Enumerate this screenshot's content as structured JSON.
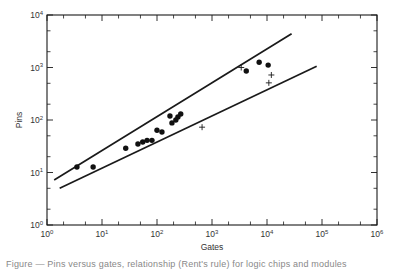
{
  "chart_data": {
    "type": "scatter",
    "title": "",
    "xlabel": "Gates",
    "ylabel": "Pins",
    "xscale": "log",
    "yscale": "log",
    "xlim": [
      1,
      1000000
    ],
    "ylim": [
      1,
      10000
    ],
    "grid": false,
    "legend": null,
    "x_tick_labels": [
      "10^0",
      "10^1",
      "10^2",
      "10^3",
      "10^4",
      "10^5",
      "10^6"
    ],
    "y_tick_labels": [
      "10^0",
      "10^1",
      "10^2",
      "10^3",
      "10^4"
    ],
    "series": [
      {
        "name": "dots",
        "marker": "filled-circle",
        "points": [
          [
            3.5,
            12.7
          ],
          [
            6.9,
            12.7
          ],
          [
            27,
            29
          ],
          [
            45,
            35
          ],
          [
            55,
            38
          ],
          [
            66,
            41
          ],
          [
            81,
            41
          ],
          [
            100,
            64
          ],
          [
            123,
            59
          ],
          [
            172,
            119
          ],
          [
            187,
            88
          ],
          [
            220,
            100
          ],
          [
            240,
            114
          ],
          [
            270,
            130
          ],
          [
            4200,
            860
          ],
          [
            7200,
            1260
          ],
          [
            10500,
            1110
          ]
        ]
      },
      {
        "name": "crosses",
        "marker": "plus",
        "points": [
          [
            660,
            73
          ],
          [
            3400,
            1000
          ],
          [
            12000,
            720
          ],
          [
            10800,
            510
          ]
        ]
      },
      {
        "name": "upper-bound-line",
        "type": "line",
        "points": [
          [
            1.35,
            7.2
          ],
          [
            28000,
            4400
          ]
        ]
      },
      {
        "name": "lower-bound-line",
        "type": "line",
        "points": [
          [
            1.7,
            5
          ],
          [
            80000,
            1060
          ]
        ]
      }
    ]
  },
  "axes": {
    "x_label": "Gates",
    "y_label": "Pins",
    "x_ticks": [
      {
        "base": "10",
        "exp": "0"
      },
      {
        "base": "10",
        "exp": "1"
      },
      {
        "base": "10",
        "exp": "2"
      },
      {
        "base": "10",
        "exp": "3"
      },
      {
        "base": "10",
        "exp": "4"
      },
      {
        "base": "10",
        "exp": "5"
      },
      {
        "base": "10",
        "exp": "6"
      }
    ],
    "y_ticks": [
      {
        "base": "10",
        "exp": "0"
      },
      {
        "base": "10",
        "exp": "1"
      },
      {
        "base": "10",
        "exp": "2"
      },
      {
        "base": "10",
        "exp": "3"
      },
      {
        "base": "10",
        "exp": "4"
      }
    ]
  },
  "caption": "Figure — Pins versus gates, relationship (Rent's rule) for logic chips and modules"
}
